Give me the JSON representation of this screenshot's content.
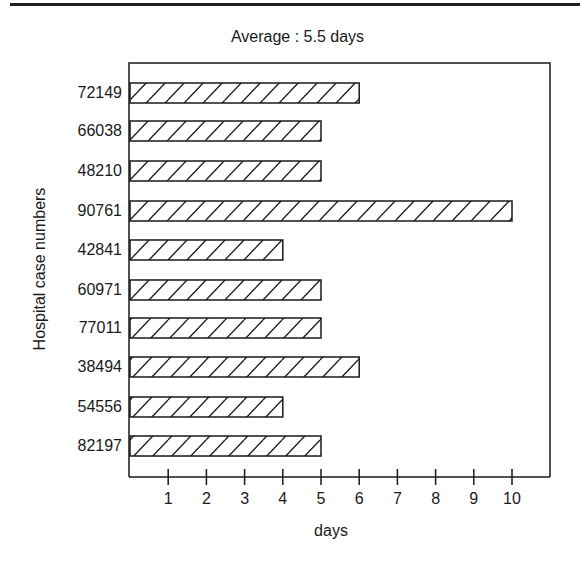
{
  "chart_data": {
    "type": "bar",
    "orientation": "horizontal",
    "title": "Average : 5.5 days",
    "xlabel": "days",
    "ylabel": "Hospital case numbers",
    "categories": [
      "72149",
      "66038",
      "48210",
      "90761",
      "42841",
      "60971",
      "77011",
      "38494",
      "54556",
      "82197"
    ],
    "values": [
      6,
      5,
      5,
      10,
      4,
      5,
      5,
      6,
      4,
      5
    ],
    "xticks": [
      "1",
      "2",
      "3",
      "4",
      "5",
      "6",
      "7",
      "8",
      "9",
      "10"
    ],
    "xlim": [
      0,
      11
    ],
    "grid": false,
    "legend": null,
    "bar_fill": "diagonal-hatch",
    "colors": {
      "ink": "#1a1a1a",
      "background": "#ffffff"
    }
  }
}
